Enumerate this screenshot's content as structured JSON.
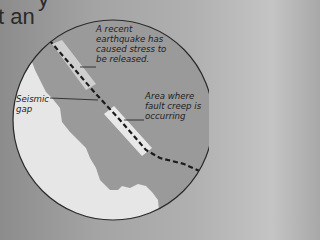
{
  "page": {
    "partial_heading": "t an",
    "partial_top_char": "y"
  },
  "diagram": {
    "type": "map-inset",
    "colors": {
      "land": "#9a9a9a",
      "ocean": "#e6e6e6",
      "highlight": "#cfcfcf",
      "fault_line": "#1a1a1a",
      "border": "#2a2a2a"
    },
    "labels": {
      "recent_quake": "A recent earthquake has caused stress to be released.",
      "recent_quake_lines": [
        "A recent",
        "earthquake has",
        "caused stress to",
        "be released."
      ],
      "seismic_gap_lines": [
        "Seismic",
        "gap"
      ],
      "fault_creep_lines": [
        "Area where",
        "fault creep is",
        "occurring"
      ]
    }
  }
}
